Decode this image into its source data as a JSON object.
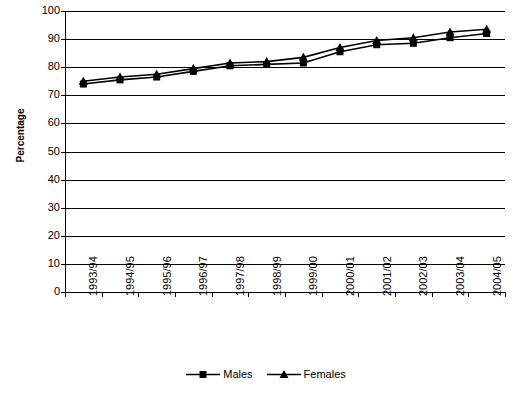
{
  "chart_data": {
    "type": "line",
    "title": "",
    "xlabel": "",
    "ylabel": "Percentage",
    "ylim": [
      0,
      100
    ],
    "ytick_step": 10,
    "yticks": [
      100,
      90,
      80,
      70,
      60,
      50,
      40,
      30,
      20,
      10,
      0
    ],
    "grid": true,
    "legend_position": "bottom",
    "categories": [
      "1993/94",
      "1994/95",
      "1995/96",
      "1996/97",
      "1997/98",
      "1998/99",
      "1999/00",
      "2000/01",
      "2001/02",
      "2002/03",
      "2003/04",
      "2004/05"
    ],
    "series": [
      {
        "name": "Males",
        "marker": "square",
        "color": "#000000",
        "values": [
          74,
          75.5,
          76.5,
          78.5,
          80.5,
          81,
          81.5,
          85.5,
          88,
          88.5,
          90.5,
          92
        ]
      },
      {
        "name": "Females",
        "marker": "triangle",
        "color": "#000000",
        "values": [
          75,
          76.5,
          77.5,
          79.5,
          81.5,
          82,
          83.5,
          87,
          89.5,
          90.5,
          92.5,
          93.5
        ]
      }
    ]
  },
  "axis": {
    "y_title": "Percentage"
  },
  "legend": {
    "items": [
      {
        "label": "Males",
        "marker": "square-marker"
      },
      {
        "label": "Females",
        "marker": "triangle-marker"
      }
    ]
  }
}
